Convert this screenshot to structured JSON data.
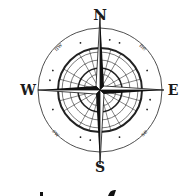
{
  "compass": {
    "cardinals": {
      "north": "N",
      "south": "S",
      "west": "W",
      "east": "E"
    },
    "intercardinals": {
      "northwest": "nw",
      "northeast": "ne",
      "southwest": "sw",
      "southeast": "se"
    },
    "colors": {
      "ink": "#111111",
      "background": "#ffffff"
    }
  }
}
